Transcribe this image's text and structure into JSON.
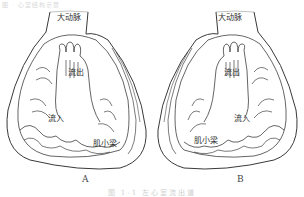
{
  "header": {
    "faint_text": "图 · 心室结构示意"
  },
  "figure": {
    "panels": [
      {
        "id": "A",
        "letter": "A",
        "labels": {
          "aorta": "大动脉",
          "outflow": "流出",
          "inflow": "流入",
          "trabeculae": "肌小梁"
        }
      },
      {
        "id": "B",
        "letter": "B",
        "labels": {
          "aorta": "大动脉",
          "outflow": "流出",
          "inflow": "流入",
          "trabeculae": "肌小梁"
        }
      }
    ],
    "caption": "图 1-1  左心室流出道"
  }
}
